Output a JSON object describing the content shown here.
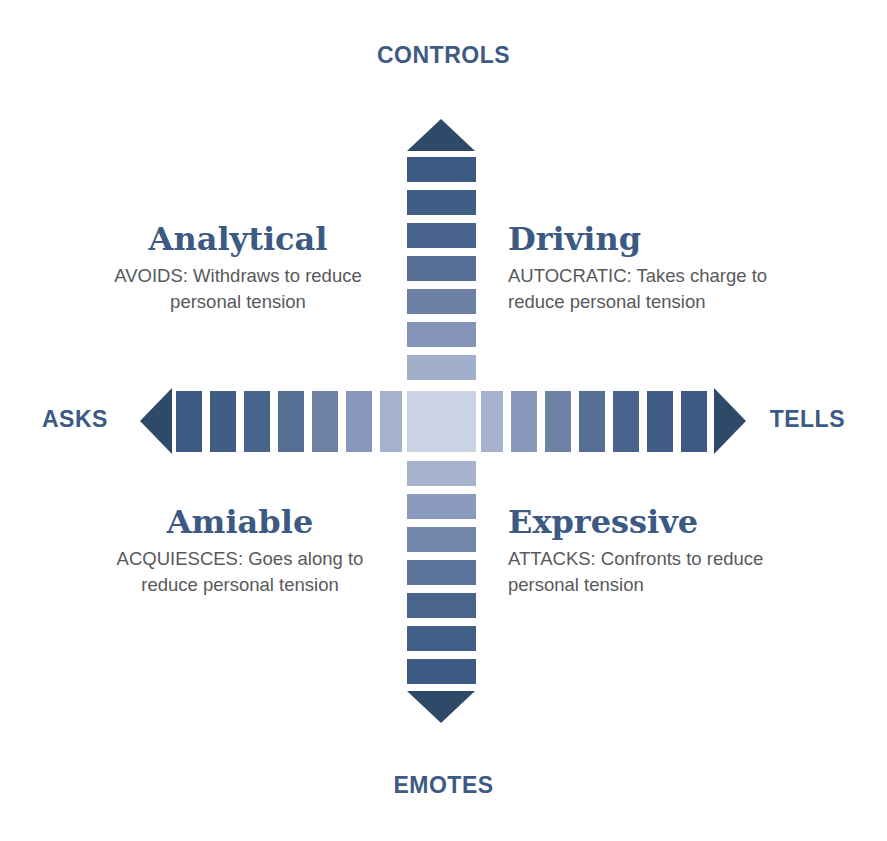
{
  "axes": {
    "top_label": "CONTROLS",
    "bottom_label": "EMOTES",
    "left_label": "ASKS",
    "right_label": "TELLS"
  },
  "quadrants": [
    {
      "id": "analytical",
      "title": "Analytical",
      "description": "AVOIDS: Withdraws to reduce personal tension",
      "position": "top-left"
    },
    {
      "id": "driving",
      "title": "Driving",
      "description": "AUTOCRATIC: Takes charge to reduce personal tension",
      "position": "top-right"
    },
    {
      "id": "amiable",
      "title": "Amiable",
      "description": "ACQUIESCES: Goes along to reduce personal tension",
      "position": "bottom-left"
    },
    {
      "id": "expressive",
      "title": "Expressive",
      "description": "ATTACKS: Confronts to reduce personal tension",
      "position": "bottom-right"
    }
  ],
  "colors": {
    "label_blue": "#3C5A84",
    "body_gray": "#58595B",
    "arrow_navy": "#2F4968",
    "darkest_segment": "#3D5A82",
    "lightest_segment": "#C9D3E4",
    "background": "#FFFFFF"
  },
  "chart_data": {
    "type": "diagram",
    "vertical_axis": {
      "top": "CONTROLS",
      "bottom": "EMOTES",
      "segments_above_center": 7,
      "segments_below_center": 7,
      "has_arrowheads": true
    },
    "horizontal_axis": {
      "left": "ASKS",
      "right": "TELLS",
      "segments_left_of_center": 7,
      "segments_right_of_center": 7,
      "has_arrowheads": true
    },
    "gradient_ramp": [
      "#3D5A82",
      "#44618A",
      "#4C6890",
      "#5B7398",
      "#7286AB",
      "#8999BC",
      "#A3B0CC",
      "#C9D3E4"
    ]
  },
  "vertical_segments_top": [
    {
      "y": 157,
      "height": 25,
      "color": "#3D5A82"
    },
    {
      "y": 190,
      "height": 25,
      "color": "#405D85"
    },
    {
      "y": 223,
      "height": 25,
      "color": "#47638B"
    },
    {
      "y": 256,
      "height": 25,
      "color": "#566E94"
    },
    {
      "y": 289,
      "height": 25,
      "color": "#6B80A4"
    },
    {
      "y": 322,
      "height": 25,
      "color": "#8494B8"
    },
    {
      "y": 355,
      "height": 25,
      "color": "#A2AFCB"
    }
  ],
  "vertical_segments_bottom": [
    {
      "y": 461,
      "height": 25,
      "color": "#A8B4CE"
    },
    {
      "y": 494,
      "height": 25,
      "color": "#8B9BBE"
    },
    {
      "y": 527,
      "height": 25,
      "color": "#7286AB"
    },
    {
      "y": 560,
      "height": 25,
      "color": "#5B7399"
    },
    {
      "y": 593,
      "height": 25,
      "color": "#4A658C"
    },
    {
      "y": 626,
      "height": 25,
      "color": "#425F87"
    },
    {
      "y": 659,
      "height": 25,
      "color": "#3D5A82"
    }
  ],
  "horizontal_segments_left": [
    {
      "x": 176,
      "width": 26,
      "color": "#3D5A82"
    },
    {
      "x": 210,
      "width": 26,
      "color": "#415D86"
    },
    {
      "x": 244,
      "width": 26,
      "color": "#49648C"
    },
    {
      "x": 278,
      "width": 26,
      "color": "#586F95"
    },
    {
      "x": 312,
      "width": 26,
      "color": "#6E82A6"
    },
    {
      "x": 346,
      "width": 26,
      "color": "#8897BB"
    },
    {
      "x": 380,
      "width": 22,
      "color": "#A6B2CD"
    }
  ],
  "horizontal_segments_right": [
    {
      "x": 481,
      "width": 22,
      "color": "#A6B2CD"
    },
    {
      "x": 511,
      "width": 26,
      "color": "#8897BB"
    },
    {
      "x": 545,
      "width": 26,
      "color": "#6E82A6"
    },
    {
      "x": 579,
      "width": 26,
      "color": "#586F95"
    },
    {
      "x": 613,
      "width": 26,
      "color": "#49648C"
    },
    {
      "x": 647,
      "width": 26,
      "color": "#415D86"
    },
    {
      "x": 681,
      "width": 26,
      "color": "#3D5A82"
    }
  ],
  "center_color": "#C9D3E4"
}
